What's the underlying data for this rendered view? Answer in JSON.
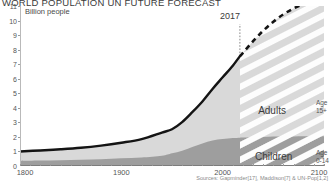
{
  "header": {
    "title": "WORLD POPULATION UN FUTURE FORECAST",
    "subtitle": "Billion people"
  },
  "annotations": {
    "year_marker": "2017",
    "adults_label": "Adults",
    "children_label": "Children",
    "age_adults": "Age\n15+",
    "age_adults_line1": "Age",
    "age_adults_line2": "15+",
    "age_children_line1": "Age",
    "age_children_line2": "0-14"
  },
  "source": "Sources: Gapminder[17], Maddison[7] & UN-Pop[1,2]",
  "colors": {
    "adults": "#d8d8d8",
    "children": "#9d9d9d",
    "total_line": "#1a1a1a",
    "axis": "#9a9a9a",
    "background": "#ffffff"
  },
  "chart_data": {
    "type": "area",
    "title": "WORLD POPULATION UN FUTURE FORECAST",
    "subtitle": "Billion people",
    "xlabel": "",
    "ylabel": "Billion people",
    "xlim": [
      1800,
      2100
    ],
    "ylim": [
      0,
      11
    ],
    "yticks": [
      0,
      1,
      2,
      3,
      4,
      5,
      6,
      7,
      8,
      9,
      10,
      11
    ],
    "xticks": [
      1800,
      1900,
      2000,
      2100
    ],
    "xtick_minor_step": 10,
    "grid": false,
    "legend": "inline-band-labels",
    "forecast_start": 2017,
    "forecast_style": "diagonal-hatch-with-dashed-line",
    "x": [
      1800,
      1820,
      1840,
      1860,
      1880,
      1900,
      1920,
      1940,
      1950,
      1960,
      1970,
      1980,
      1990,
      2000,
      2010,
      2017,
      2020,
      2030,
      2040,
      2050,
      2060,
      2070,
      2080,
      2090,
      2100
    ],
    "series": [
      {
        "name": "Children",
        "values": [
          0.35,
          0.37,
          0.4,
          0.43,
          0.47,
          0.53,
          0.58,
          0.7,
          0.87,
          1.05,
          1.3,
          1.55,
          1.75,
          1.85,
          1.92,
          1.95,
          1.96,
          1.98,
          2.0,
          2.02,
          2.03,
          2.03,
          2.04,
          2.04,
          2.05
        ]
      },
      {
        "name": "Adults",
        "values": [
          0.65,
          0.7,
          0.75,
          0.82,
          0.93,
          1.07,
          1.27,
          1.6,
          1.66,
          1.97,
          2.4,
          2.89,
          3.55,
          4.25,
          4.98,
          5.6,
          5.82,
          6.6,
          7.3,
          7.9,
          8.4,
          8.8,
          9.1,
          9.35,
          9.55
        ]
      },
      {
        "name": "Total population",
        "values": [
          1.0,
          1.07,
          1.15,
          1.25,
          1.4,
          1.6,
          1.85,
          2.3,
          2.53,
          3.02,
          3.7,
          4.44,
          5.3,
          6.1,
          6.9,
          7.55,
          7.78,
          8.58,
          9.3,
          9.92,
          10.43,
          10.83,
          11.14,
          11.39,
          11.6
        ]
      }
    ]
  }
}
